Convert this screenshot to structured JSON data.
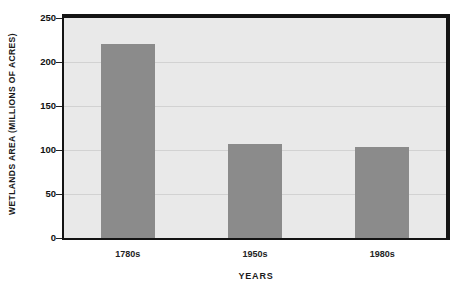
{
  "chart_data": {
    "type": "bar",
    "title": "",
    "categories": [
      "1780s",
      "1950s",
      "1980s"
    ],
    "values": [
      220,
      107,
      103
    ],
    "series": [
      {
        "name": "Wetlands Area",
        "values": [
          220,
          107,
          103
        ]
      }
    ],
    "xlabel": "Years",
    "ylabel": "Wetlands Area (Millions of Acres)",
    "ylim": [
      0,
      250
    ],
    "yticks": [
      0,
      50,
      100,
      150,
      200,
      250
    ],
    "ytick_labels": [
      "0",
      "50",
      "100",
      "150",
      "200",
      "250"
    ],
    "grid": true,
    "legend": false,
    "bar_color": "#8b8b8b",
    "plot_background": "#e9e9e9",
    "frame_color": "#141414",
    "gridline_color": "#d2d2d2"
  },
  "axes": {
    "y_title": "WETLANDS AREA (MILLIONS OF ACRES)",
    "x_title": "YEARS"
  },
  "caption": {
    "text": ""
  }
}
